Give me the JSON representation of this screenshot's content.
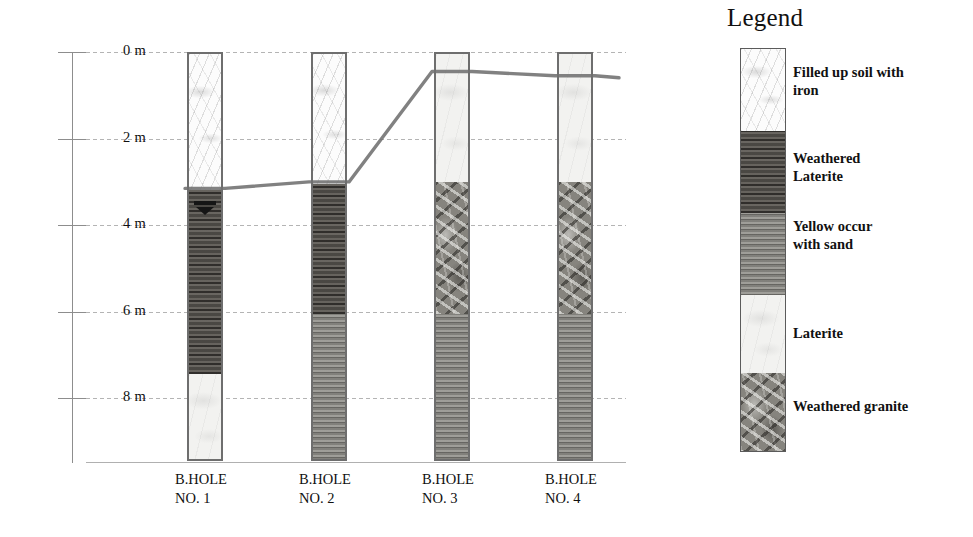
{
  "chart_data": {
    "type": "table",
    "title": "",
    "ylabel": "Depth",
    "depth_axis": {
      "unit": "m",
      "ticks": [
        "0 m",
        "2 m",
        "4 m",
        "6 m",
        "8 m"
      ],
      "tick_values": [
        0,
        2,
        4,
        6,
        8
      ],
      "range": [
        0,
        9.5
      ],
      "grid": true
    },
    "lithologies": [
      {
        "key": "filled_soil_iron",
        "label": "Filled up soil with iron",
        "color": "#fcfcfc"
      },
      {
        "key": "weathered_laterite",
        "label": "Weathered Laterite",
        "color": "#5f5c57"
      },
      {
        "key": "yellow_sand",
        "label": "Yellow occur with sand",
        "color": "#8e8d88"
      },
      {
        "key": "laterite",
        "label": "Laterite",
        "color": "#f2f2f0"
      },
      {
        "key": "weathered_granite",
        "label": "Weathered granite",
        "color": "#86847e"
      }
    ],
    "boreholes": [
      {
        "name": "B.HOLE NO. 1",
        "label_line1": "B.HOLE",
        "label_line2": "NO. 1",
        "water_table_depth_m": 3.4,
        "layers": [
          {
            "lith": "filled_soil_iron",
            "top_m": 0.0,
            "base_m": 3.15
          },
          {
            "lith": "weathered_laterite",
            "top_m": 3.15,
            "base_m": 7.4
          },
          {
            "lith": "laterite",
            "top_m": 7.4,
            "base_m": 9.45
          }
        ]
      },
      {
        "name": "B.HOLE NO. 2",
        "label_line1": "B.HOLE",
        "label_line2": "NO. 2",
        "water_table_depth_m": null,
        "layers": [
          {
            "lith": "filled_soil_iron",
            "top_m": 0.0,
            "base_m": 3.0
          },
          {
            "lith": "weathered_laterite",
            "top_m": 3.0,
            "base_m": 6.0
          },
          {
            "lith": "yellow_sand",
            "top_m": 6.0,
            "base_m": 9.45
          }
        ]
      },
      {
        "name": "B.HOLE NO. 3",
        "label_line1": "B.HOLE",
        "label_line2": "NO. 3",
        "water_table_depth_m": null,
        "layers": [
          {
            "lith": "laterite",
            "top_m": 0.0,
            "base_m": 2.95
          },
          {
            "lith": "weathered_granite",
            "top_m": 2.95,
            "base_m": 6.0
          },
          {
            "lith": "yellow_sand",
            "top_m": 6.0,
            "base_m": 9.45
          }
        ]
      },
      {
        "name": "B.HOLE NO. 4",
        "label_line1": "B.HOLE",
        "label_line2": "NO. 4",
        "water_table_depth_m": null,
        "layers": [
          {
            "lith": "laterite",
            "top_m": 0.0,
            "base_m": 2.95
          },
          {
            "lith": "weathered_granite",
            "top_m": 2.95,
            "base_m": 6.0
          },
          {
            "lith": "yellow_sand",
            "top_m": 6.0,
            "base_m": 9.45
          }
        ]
      }
    ],
    "correlation_line": {
      "description": "weathering-profile correlation line across borehole tops",
      "points_m": [
        {
          "x_bh": 1,
          "depth_m": 3.15
        },
        {
          "x_bh": 2,
          "depth_m": 3.0
        },
        {
          "x_bh": 3,
          "depth_m": 0.45
        },
        {
          "x_bh": 4,
          "depth_m": 0.55
        }
      ]
    }
  },
  "axis": {
    "labels": [
      {
        "text": "0 m"
      },
      {
        "text": "2 m"
      },
      {
        "text": "4 m"
      },
      {
        "text": "6 m"
      },
      {
        "text": "8 m"
      }
    ]
  },
  "boreholes": [
    {
      "line1": "B.HOLE",
      "line2": "NO. 1"
    },
    {
      "line1": "B.HOLE",
      "line2": "NO. 2"
    },
    {
      "line1": "B.HOLE",
      "line2": "NO. 3"
    },
    {
      "line1": "B.HOLE",
      "line2": "NO. 4"
    }
  ],
  "legend": {
    "title": "Legend",
    "items": [
      {
        "label": "Filled up soil with iron",
        "line1": "Filled up soil with",
        "line2": "iron"
      },
      {
        "label": "Weathered Laterite",
        "line1": "Weathered",
        "line2": "Laterite"
      },
      {
        "label": "Yellow occur with sand",
        "line1": "Yellow occur",
        "line2": "with sand"
      },
      {
        "label": "Laterite",
        "line1": "Laterite",
        "line2": ""
      },
      {
        "label": "Weathered granite",
        "line1": "Weathered granite",
        "line2": ""
      }
    ]
  },
  "colors": {
    "filled_soil_iron": "#fcfcfc",
    "weathered_laterite": "#5f5c57",
    "yellow_sand": "#8e8d88",
    "laterite": "#f2f2f0",
    "weathered_granite": "#86847e",
    "grid": "#b4b4b4",
    "axis": "#8d8d8d",
    "profile_line": "#6f6f6f"
  }
}
